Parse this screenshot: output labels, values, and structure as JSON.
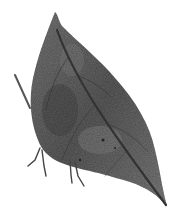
{
  "image": {
    "subject": "Leaf butterfly with wings closed, resembling a dry leaf",
    "style": "Monochrome stippled pencil/ink drawing",
    "background_color": "#ffffff",
    "colors": {
      "wing_fill": "#6a6a6a",
      "wing_dark": "#3a3a3a",
      "wing_light": "#9a9a9a",
      "midrib": "#222222",
      "legs": "#4a4a4a"
    }
  }
}
